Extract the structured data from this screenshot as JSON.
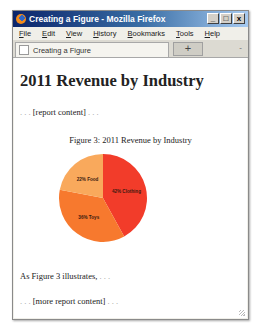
{
  "window": {
    "title": "Creating a Figure - Mozilla Firefox",
    "controls": {
      "minimize": "_",
      "maximize": "□",
      "close": "x"
    }
  },
  "menubar": {
    "items": [
      {
        "label": "File"
      },
      {
        "label": "Edit"
      },
      {
        "label": "View"
      },
      {
        "label": "History"
      },
      {
        "label": "Bookmarks"
      },
      {
        "label": "Tools"
      },
      {
        "label": "Help"
      }
    ]
  },
  "tabs": {
    "active_label": "Creating a Figure",
    "new_tab_label": "+",
    "list_all_label": "-"
  },
  "page": {
    "heading": "2011 Revenue by Industry",
    "para1_prefix": ". . . ",
    "para1_text": "[report content]",
    "para1_suffix": " . . .",
    "figure_caption": "Figure 3: 2011 Revenue by Industry",
    "para2_text": "As Figure 3 illustrates,",
    "para2_suffix": " . . .",
    "para3_prefix": ". . . ",
    "para3_text": "[more report content]",
    "para3_suffix": " . . ."
  },
  "chart_data": {
    "type": "pie",
    "title": "Figure 3: 2011 Revenue by Industry",
    "categories": [
      "Clothing",
      "Toys",
      "Food"
    ],
    "values": [
      42,
      36,
      22
    ],
    "labels": [
      "42% Clothing",
      "36% Toys",
      "22% Food"
    ],
    "colors": [
      "#f23c2a",
      "#f7792e",
      "#f9a95c"
    ],
    "start_angle_deg": 0,
    "direction": "clockwise",
    "legend": "none (inline labels)"
  }
}
